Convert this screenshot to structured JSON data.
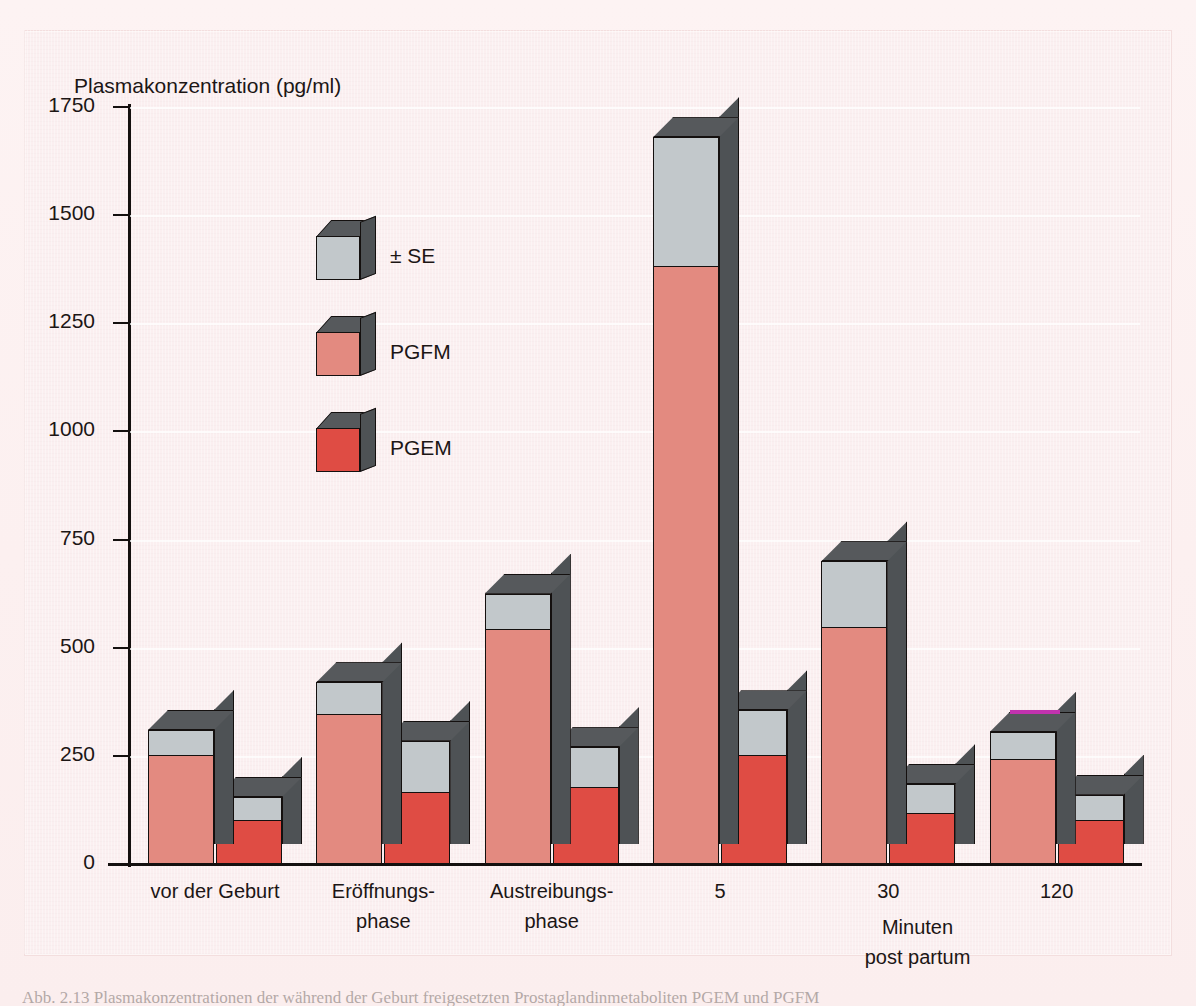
{
  "figure": {
    "background_color": "#fbeff0",
    "page_color": "#fdf2f2",
    "caption_partial": "Abb. 2.13   Plasmakonzentrationen der während der Geburt freigesetzten Prostaglandinmetaboliten PGEM und PGFM"
  },
  "axis": {
    "y_title": "Plasmakonzentration (pg/ml)",
    "y_ticks": [
      "1750",
      "1500",
      "1250",
      "1000",
      "750",
      "500",
      "250",
      "0"
    ],
    "x_note_line1": "Minuten",
    "x_note_line2": "post partum"
  },
  "legend": {
    "items": [
      {
        "label": "± SE",
        "color": "#c2c8cb",
        "icon": "cube-icon"
      },
      {
        "label": "PGFM",
        "color": "#e38a80",
        "icon": "cube-icon"
      },
      {
        "label": "PGEM",
        "color": "#df4c44",
        "icon": "cube-icon"
      }
    ]
  },
  "colors": {
    "pgfm": "#e38a80",
    "pgem": "#df4c44",
    "se": "#c2c8cb",
    "box_side": "#4e5255",
    "box_top": "#56595c",
    "outline": "#14100f",
    "magenta_marker": "#c232ae"
  },
  "chart_data": {
    "type": "bar",
    "title": "",
    "xlabel": "Minuten post partum",
    "ylabel": "Plasmakonzentration (pg/ml)",
    "ylim": [
      0,
      1750
    ],
    "ytick_step": 250,
    "grid": true,
    "legend_position": "inside-upper-left",
    "style": "3d-isometric-grouped-bars-with-SE-cap",
    "categories": [
      "vor der Geburt",
      "Eröffnungs-\nphase",
      "Austreibungs-\nphase",
      "5",
      "30",
      "120"
    ],
    "category_labels": [
      [
        "vor der Geburt"
      ],
      [
        "Eröffnungs-",
        "phase"
      ],
      [
        "Austreibungs-",
        "phase"
      ],
      [
        "5"
      ],
      [
        "30"
      ],
      [
        "120"
      ]
    ],
    "series": [
      {
        "name": "PGFM",
        "color": "#e38a80",
        "values": [
          250,
          345,
          540,
          1380,
          545,
          240
        ],
        "values_se": [
          60,
          75,
          85,
          300,
          155,
          65
        ],
        "tops_with_se": [
          310,
          420,
          625,
          1680,
          700,
          305
        ]
      },
      {
        "name": "PGEM",
        "color": "#df4c44",
        "values": [
          100,
          165,
          175,
          250,
          115,
          100
        ],
        "values_se": [
          55,
          120,
          95,
          105,
          70,
          60
        ],
        "tops_with_se": [
          155,
          285,
          270,
          355,
          185,
          160
        ]
      }
    ],
    "annotations": [
      {
        "text": "",
        "type": "magenta-edge-marker",
        "color": "#c232ae",
        "target": "PGFM bar of category 120 (top edge)"
      }
    ]
  }
}
